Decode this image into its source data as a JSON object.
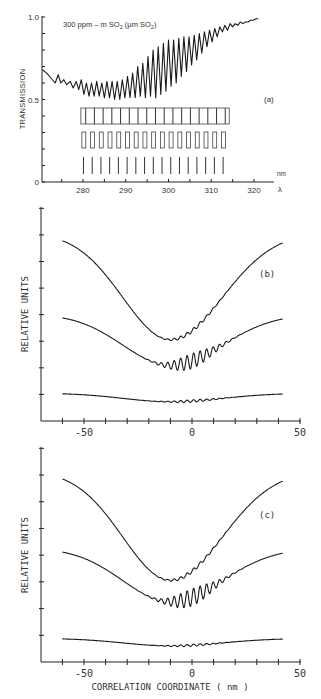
{
  "chart_data": [
    {
      "id": "a",
      "type": "line",
      "panel_label": "(a)",
      "title": "300 ppm – m SO₂  (µm SO₂)",
      "xlabel": "λ",
      "x_unit": "nm",
      "ylabel": "TRANSMISSION",
      "xlim": [
        270,
        322
      ],
      "ylim": [
        0,
        1.0
      ],
      "x_ticks": [
        280,
        290,
        300,
        310,
        320
      ],
      "y_tick_labels": [
        "0",
        "0.5",
        "1.0"
      ],
      "series": [
        {
          "name": "SO2 transmission",
          "x": [
            270.5,
            271.5,
            272.5,
            273.5,
            274.2,
            274.8,
            275.5,
            276.2,
            277.0,
            277.7,
            278.4,
            279.0,
            279.6,
            280.2,
            280.8,
            281.4,
            282.0,
            282.6,
            283.2,
            283.8,
            284.4,
            285.0,
            285.6,
            286.2,
            286.8,
            287.4,
            288.0,
            288.6,
            289.2,
            289.8,
            290.4,
            291.0,
            291.6,
            292.2,
            292.8,
            293.4,
            294.0,
            294.6,
            295.2,
            295.8,
            296.4,
            297.0,
            297.6,
            298.2,
            298.8,
            299.4,
            300.0,
            300.6,
            301.2,
            301.8,
            302.4,
            303.0,
            303.6,
            304.2,
            304.8,
            305.4,
            306.0,
            306.6,
            307.2,
            307.8,
            308.4,
            309.0,
            309.6,
            310.2,
            310.8,
            311.4,
            312.0,
            312.6,
            313.2,
            313.8,
            314.4,
            315.0,
            315.6,
            316.2,
            316.8,
            317.4,
            318.0,
            318.6,
            319.2,
            319.8,
            320.5,
            321.0
          ],
          "y": [
            0.68,
            0.66,
            0.63,
            0.6,
            0.65,
            0.6,
            0.62,
            0.59,
            0.61,
            0.57,
            0.61,
            0.56,
            0.62,
            0.53,
            0.6,
            0.52,
            0.6,
            0.52,
            0.61,
            0.52,
            0.6,
            0.51,
            0.61,
            0.51,
            0.61,
            0.5,
            0.61,
            0.5,
            0.62,
            0.51,
            0.64,
            0.51,
            0.66,
            0.51,
            0.7,
            0.52,
            0.72,
            0.51,
            0.76,
            0.52,
            0.8,
            0.51,
            0.82,
            0.53,
            0.84,
            0.55,
            0.86,
            0.58,
            0.86,
            0.6,
            0.87,
            0.64,
            0.88,
            0.67,
            0.88,
            0.71,
            0.89,
            0.74,
            0.9,
            0.78,
            0.91,
            0.82,
            0.92,
            0.85,
            0.93,
            0.88,
            0.94,
            0.91,
            0.95,
            0.92,
            0.96,
            0.94,
            0.96,
            0.95,
            0.97,
            0.96,
            0.97,
            0.97,
            0.98,
            0.98,
            0.99,
            0.99
          ]
        }
      ],
      "slit_masks": {
        "rows": 3,
        "x_start": 279.5,
        "x_end": 314.2,
        "slit_count": 17
      },
      "grid": false
    },
    {
      "id": "b",
      "type": "line",
      "panel_label": "(b)",
      "xlabel": "",
      "ylabel": "RELATIVE UNITS",
      "xlim": [
        -70,
        50
      ],
      "x_ticks": [
        -50,
        0,
        50
      ],
      "x_minor_step": 10,
      "y_tick_count": 8,
      "series": [
        {
          "name": "upper",
          "offset": 0.88,
          "depth": 0.5,
          "ripple": 0.008
        },
        {
          "name": "middle",
          "offset": 0.5,
          "depth": 0.24,
          "ripple": 0.035
        },
        {
          "name": "lower",
          "offset": 0.13,
          "depth": 0.04,
          "ripple": 0.006
        }
      ],
      "x_range": [
        -60,
        42
      ],
      "min_at": -10,
      "grid": false
    },
    {
      "id": "c",
      "type": "line",
      "panel_label": "(c)",
      "xlabel": "CORRELATION COORDINATE ( nm )",
      "ylabel": "RELATIVE UNITS",
      "xlim": [
        -70,
        50
      ],
      "x_ticks": [
        -50,
        0,
        50
      ],
      "x_minor_step": 10,
      "y_tick_count": 8,
      "series": [
        {
          "name": "upper",
          "offset": 0.89,
          "depth": 0.51,
          "ripple": 0.008
        },
        {
          "name": "middle",
          "offset": 0.53,
          "depth": 0.25,
          "ripple": 0.04
        },
        {
          "name": "lower",
          "offset": 0.11,
          "depth": 0.035,
          "ripple": 0.005
        }
      ],
      "x_range": [
        -60,
        42
      ],
      "min_at": -10,
      "grid": false
    }
  ],
  "panels": {
    "a": {
      "title": "300 ppm – m SO",
      "title_sub": "2",
      "title_paren": "(µm SO",
      "title_paren_sub": "2",
      "title_paren_close": ")",
      "label": "(a)",
      "ylabel": "TRANSMISSION",
      "y_ticks": {
        "top": "1.0",
        "mid": "0.5",
        "bottom": "0"
      },
      "x_ticks": [
        "280",
        "290",
        "300",
        "310",
        "320"
      ],
      "x_unit": "nm",
      "x_symbol": "λ"
    },
    "b": {
      "label": "(b)",
      "ylabel": "RELATIVE UNITS",
      "x_ticks": [
        "-50",
        "0",
        "50"
      ]
    },
    "c": {
      "label": "(c)",
      "ylabel": "RELATIVE UNITS",
      "x_ticks": [
        "-50",
        "0",
        "50"
      ],
      "xlabel": "CORRELATION COORDINATE ( nm )"
    }
  },
  "colors": {
    "ink": "#1a1a1a",
    "background": "#ffffff"
  }
}
